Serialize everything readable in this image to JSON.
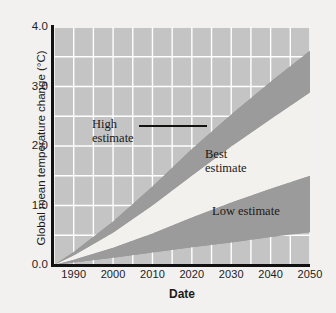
{
  "chart_data": {
    "type": "area",
    "title": "",
    "xlabel": "Date",
    "ylabel": "Global mean temperature change (°C)",
    "xlim": [
      1985,
      2050
    ],
    "ylim": [
      0.0,
      4.0
    ],
    "xticks": [
      "1990",
      "2000",
      "2010",
      "2020",
      "2030",
      "2040",
      "2050"
    ],
    "xtick_values": [
      1990,
      2000,
      2010,
      2020,
      2030,
      2040,
      2050
    ],
    "yticks": [
      "0.0",
      "1.0",
      "2.0",
      "3.0",
      "4.0"
    ],
    "ytick_values": [
      0.0,
      1.0,
      2.0,
      3.0,
      4.0
    ],
    "grid": "on",
    "grid_color": "#ffffff",
    "grid_x_step": 5,
    "grid_y_step": 0.5,
    "plot_background": "#c4c4c4",
    "band_dark_color": "#9b9b9b",
    "band_light_color": "#f3f1ee",
    "legend": "none",
    "x": [
      1985,
      1990,
      2000,
      2010,
      2020,
      2030,
      2040,
      2050
    ],
    "series": [
      {
        "name": "High estimate",
        "role": "upper-bound",
        "fill": "#9b9b9b",
        "values": [
          0.0,
          0.22,
          0.73,
          1.32,
          1.95,
          2.53,
          3.08,
          3.6
        ]
      },
      {
        "name": "Best estimate upper edge",
        "role": "best-upper",
        "fill": "#f3f1ee",
        "values": [
          0.0,
          0.16,
          0.54,
          1.0,
          1.5,
          1.99,
          2.45,
          2.9
        ]
      },
      {
        "name": "Best estimate lower edge",
        "role": "best-lower",
        "fill": "#f3f1ee",
        "values": [
          0.0,
          0.09,
          0.29,
          0.53,
          0.8,
          1.05,
          1.28,
          1.5
        ]
      },
      {
        "name": "Low estimate",
        "role": "lower-bound",
        "fill": "#9b9b9b",
        "values": [
          0.0,
          0.04,
          0.12,
          0.21,
          0.3,
          0.38,
          0.47,
          0.55
        ]
      }
    ],
    "annotations": [
      {
        "id": "high",
        "text": "High\nestimate",
        "x": 2002,
        "y": 2.45,
        "leader": true
      },
      {
        "id": "best",
        "text": "Best\nestimate",
        "x": 2023,
        "y": 1.95,
        "leader": false
      },
      {
        "id": "low",
        "text": "Low estimate",
        "x": 2025,
        "y": 0.98,
        "leader": false
      }
    ]
  },
  "axes": {
    "y_title": "Global mean temperature change (°C)",
    "x_title": "Date",
    "y_tick_labels": [
      "4.0",
      "3.0",
      "2.0",
      "1.0",
      "0.0"
    ],
    "x_tick_labels": [
      "1990",
      "2000",
      "2010",
      "2020",
      "2030",
      "2040",
      "2050"
    ]
  },
  "annotations": {
    "high": "High\nestimate",
    "best": "Best\nestimate",
    "low": "Low estimate"
  }
}
